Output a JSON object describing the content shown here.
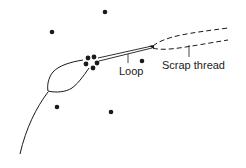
{
  "diagram": {
    "labels": {
      "loop": "Loop",
      "scrap_thread": "Scrap thread"
    },
    "colors": {
      "ink": "#1a1a1a",
      "background": "#ffffff"
    },
    "dots": [
      {
        "x": 105,
        "y": 12
      },
      {
        "x": 52,
        "y": 32
      },
      {
        "x": 142,
        "y": 61
      },
      {
        "x": 57,
        "y": 107
      },
      {
        "x": 111,
        "y": 112
      }
    ],
    "cluster_dots": [
      {
        "x": 88,
        "y": 58
      },
      {
        "x": 94,
        "y": 57
      },
      {
        "x": 86,
        "y": 64
      },
      {
        "x": 97,
        "y": 63
      },
      {
        "x": 93,
        "y": 68
      }
    ]
  }
}
